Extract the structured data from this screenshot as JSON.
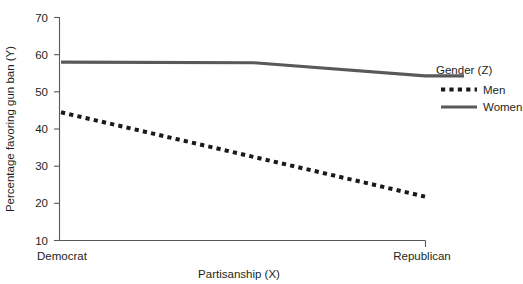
{
  "chart_data": {
    "type": "line",
    "title": "",
    "xlabel": "Partisanship (X)",
    "ylabel": "Percentage favoring gun ban (Y)",
    "categories": [
      "Democrat",
      "Republican"
    ],
    "x": [
      0,
      1
    ],
    "ylim": [
      10,
      70
    ],
    "yticks": [
      10,
      20,
      30,
      40,
      50,
      60,
      70
    ],
    "ytick_labels": [
      "10",
      "20",
      "30",
      "40",
      "50",
      "60",
      "70"
    ],
    "grid": false,
    "legend_position": "right",
    "legend_title": "Gender (Z)",
    "series": [
      {
        "name": "Men",
        "style": "dotted",
        "color": "#1a1a1a",
        "x": [
          0,
          1
        ],
        "values": [
          44.5,
          21.8
        ],
        "points": [
          {
            "x": 0.0,
            "y": 44.5
          },
          {
            "x": 1.0,
            "y": 21.8
          }
        ]
      },
      {
        "name": "Women",
        "style": "solid",
        "color": "#58595b",
        "x": [
          0,
          0.53,
          1
        ],
        "values": [
          58.0,
          57.8,
          54.3
        ],
        "points": [
          {
            "x": 0.0,
            "y": 58.0
          },
          {
            "x": 0.53,
            "y": 57.8
          },
          {
            "x": 1.0,
            "y": 54.3
          }
        ]
      }
    ]
  },
  "axes": {
    "y_title": "Percentage favoring gun ban (Y)",
    "x_title": "Partisanship (X)",
    "y_ticks": [
      "70",
      "60",
      "50",
      "40",
      "30",
      "20",
      "10"
    ],
    "x_categories": [
      "Democrat",
      "Republican"
    ]
  },
  "legend": {
    "title": "Gender (Z)",
    "entries": [
      {
        "label": "Men",
        "style": "dotted"
      },
      {
        "label": "Women",
        "style": "solid"
      }
    ]
  },
  "colors": {
    "men_line": "#1a1a1a",
    "women_line": "#58595b",
    "axis": "#58595b",
    "text": "#231f20",
    "background": "#ffffff"
  }
}
